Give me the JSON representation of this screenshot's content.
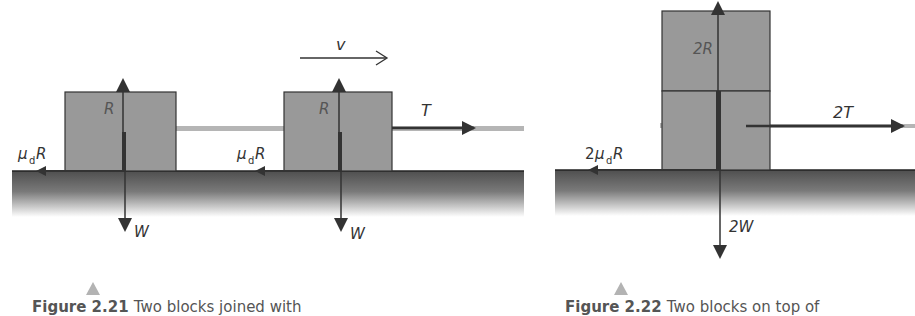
{
  "colors": {
    "block_fill": "#999999",
    "block_stroke": "#333333",
    "ground_top": "#555555",
    "ground_bottom": "#ffffff",
    "arrow": "#333333",
    "rope": "#b5b5b5",
    "marker_triangle": "#b3b3b3"
  },
  "figure_left": {
    "velocity_label": "v",
    "block1": {
      "reaction_label": "R",
      "weight_label": "W",
      "friction_label_mu": "μ",
      "friction_label_sub": "d",
      "friction_label_R": "R"
    },
    "block2": {
      "reaction_label": "R",
      "weight_label": "W",
      "friction_label_mu": "μ",
      "friction_label_sub": "d",
      "friction_label_R": "R",
      "tension_label": "T"
    },
    "caption": {
      "figure": "Figure 2.21",
      "text": "Two blocks joined with"
    }
  },
  "figure_right": {
    "reaction_label": "2R",
    "weight_label": "2W",
    "tension_label": "2T",
    "friction_label_prefix": "2",
    "friction_label_mu": "μ",
    "friction_label_sub": "d",
    "friction_label_R": "R",
    "caption": {
      "figure": "Figure 2.22",
      "text": "Two blocks on top of"
    }
  }
}
